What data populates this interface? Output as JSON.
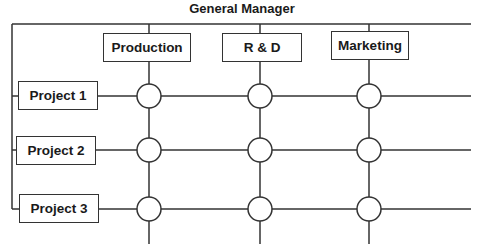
{
  "diagram": {
    "title": "General Manager",
    "type": "matrix organization",
    "departments": [
      {
        "label": "Production",
        "x": 149,
        "box": [
          103,
          33,
          88,
          29
        ]
      },
      {
        "label": "R & D",
        "x": 260,
        "box": [
          222,
          33,
          80,
          29
        ]
      },
      {
        "label": "Marketing",
        "x": 369,
        "box": [
          331,
          31,
          78,
          29
        ]
      }
    ],
    "projects": [
      {
        "label": "Project 1",
        "y": 96,
        "box": [
          18,
          81,
          80,
          29
        ]
      },
      {
        "label": "Project 2",
        "y": 150,
        "box": [
          16,
          136,
          80,
          29
        ]
      },
      {
        "label": "Project 3",
        "y": 209,
        "box": [
          19,
          194,
          80,
          29
        ]
      }
    ],
    "line_color": "#333333",
    "node_shape": "circle"
  }
}
